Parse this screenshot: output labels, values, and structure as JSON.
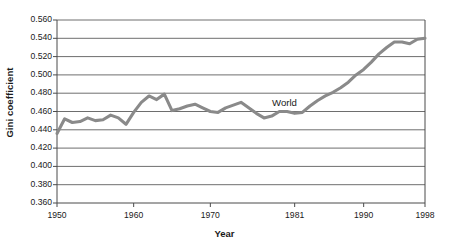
{
  "chart_data": {
    "type": "line",
    "title": "",
    "xlabel": "Year",
    "ylabel": "Gini coefficient",
    "ylim": [
      0.36,
      0.56
    ],
    "xlim": [
      1950,
      1998
    ],
    "grid": "horizontal",
    "legend_position": "inline-annotation",
    "yticks": [
      "0.560",
      "0.540",
      "0.520",
      "0.500",
      "0.480",
      "0.460",
      "0.440",
      "0.420",
      "0.400",
      "0.380",
      "0.360"
    ],
    "ytick_values": [
      0.56,
      0.54,
      0.52,
      0.5,
      0.48,
      0.46,
      0.44,
      0.42,
      0.4,
      0.38,
      0.36
    ],
    "xticks": [
      "1950",
      "1960",
      "1970",
      "1981",
      "1990",
      "1998"
    ],
    "xtick_values": [
      1950,
      1960,
      1970,
      1981,
      1990,
      1998
    ],
    "series": [
      {
        "name": "World",
        "color": "#8a8a8a",
        "annotation": "World",
        "x": [
          1950,
          1951,
          1952,
          1953,
          1954,
          1955,
          1956,
          1957,
          1958,
          1959,
          1960,
          1961,
          1962,
          1963,
          1964,
          1965,
          1966,
          1967,
          1968,
          1969,
          1970,
          1971,
          1972,
          1973,
          1974,
          1975,
          1976,
          1977,
          1978,
          1979,
          1980,
          1981,
          1982,
          1983,
          1984,
          1985,
          1986,
          1987,
          1988,
          1989,
          1990,
          1991,
          1992,
          1993,
          1994,
          1995,
          1996,
          1997,
          1998
        ],
        "values": [
          0.436,
          0.452,
          0.448,
          0.449,
          0.453,
          0.45,
          0.451,
          0.456,
          0.453,
          0.446,
          0.459,
          0.47,
          0.477,
          0.473,
          0.479,
          0.461,
          0.463,
          0.466,
          0.468,
          0.464,
          0.46,
          0.459,
          0.464,
          0.467,
          0.47,
          0.464,
          0.458,
          0.453,
          0.455,
          0.46,
          0.46,
          0.458,
          0.459,
          0.466,
          0.472,
          0.477,
          0.481,
          0.486,
          0.492,
          0.5,
          0.506,
          0.514,
          0.523,
          0.53,
          0.536,
          0.536,
          0.534,
          0.539,
          0.54
        ]
      }
    ]
  },
  "axes": {
    "ylabel": "Gini coefficient",
    "xlabel": "Year"
  },
  "annotations": {
    "world": "World"
  }
}
